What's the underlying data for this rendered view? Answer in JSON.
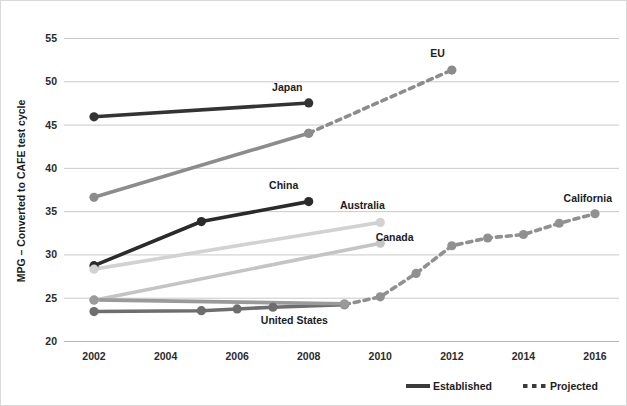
{
  "chart_data": {
    "type": "line",
    "title": "",
    "xlabel": "",
    "ylabel": "MPG – Converted to CAFE test cycle",
    "xlim": [
      2001,
      2017
    ],
    "ylim": [
      20,
      55
    ],
    "yticks": [
      20,
      25,
      30,
      35,
      40,
      45,
      50,
      55
    ],
    "xticks": [
      2002,
      2004,
      2006,
      2008,
      2010,
      2012,
      2014,
      2016
    ],
    "grid": true,
    "legend_position": "bottom-right",
    "legend": [
      {
        "label": "Established",
        "style": "solid"
      },
      {
        "label": "Projected",
        "style": "dashed"
      }
    ],
    "series": [
      {
        "name": "Japan",
        "color": "#333333",
        "label_x": 2007.4,
        "label_y": 48.9,
        "established": {
          "x": [
            2002,
            2008
          ],
          "y": [
            45.9,
            47.5
          ]
        },
        "projected": {
          "x": [],
          "y": []
        }
      },
      {
        "name": "EU",
        "color": "#8c8c8c",
        "label_x": 2011.6,
        "label_y": 52.8,
        "established": {
          "x": [
            2002,
            2008
          ],
          "y": [
            36.6,
            44.0
          ]
        },
        "projected": {
          "x": [
            2008,
            2012
          ],
          "y": [
            44.0,
            51.3
          ]
        }
      },
      {
        "name": "China",
        "color": "#2b2b2b",
        "label_x": 2007.3,
        "label_y": 37.6,
        "established": {
          "x": [
            2002,
            2005,
            2008
          ],
          "y": [
            28.7,
            33.8,
            36.1
          ]
        },
        "projected": {
          "x": [],
          "y": []
        }
      },
      {
        "name": "Australia",
        "color": "#d2d2d2",
        "label_x": 2009.5,
        "label_y": 35.2,
        "established": {
          "x": [
            2002,
            2010
          ],
          "y": [
            28.3,
            33.7
          ]
        },
        "projected": {
          "x": [],
          "y": []
        }
      },
      {
        "name": "Canada",
        "color": "#c4c4c4",
        "label_x": 2010.4,
        "label_y": 31.5,
        "established": {
          "x": [
            2002,
            2010
          ],
          "y": [
            24.7,
            31.3
          ]
        },
        "projected": {
          "x": [],
          "y": []
        }
      },
      {
        "name": "United States",
        "color": "#6e6e6e",
        "label_x": 2007.6,
        "label_y": 22.0,
        "established": {
          "x": [
            2002,
            2005,
            2006,
            2007,
            2009
          ],
          "y": [
            23.4,
            23.5,
            23.7,
            23.9,
            24.2
          ]
        },
        "projected": {
          "x": [],
          "y": []
        }
      },
      {
        "name": "California",
        "color": "#909090",
        "label_x": 2015.8,
        "label_y": 36.1,
        "established": {
          "x": [],
          "y": []
        },
        "projected": {
          "x": [
            2009,
            2010,
            2011,
            2012,
            2013,
            2014,
            2015,
            2016
          ],
          "y": [
            24.2,
            25.1,
            27.8,
            31.0,
            31.9,
            32.3,
            33.6,
            34.7
          ]
        }
      },
      {
        "name": "Canada-flat",
        "color": "#9a9a9a",
        "label_x": null,
        "label_y": null,
        "established": {
          "x": [
            2002,
            2009
          ],
          "y": [
            24.75,
            24.3
          ]
        },
        "projected": {
          "x": [],
          "y": []
        }
      }
    ]
  },
  "colors": {
    "gridline": "#c9c9c9",
    "text": "#1c1c1c",
    "background": "#ffffff"
  }
}
